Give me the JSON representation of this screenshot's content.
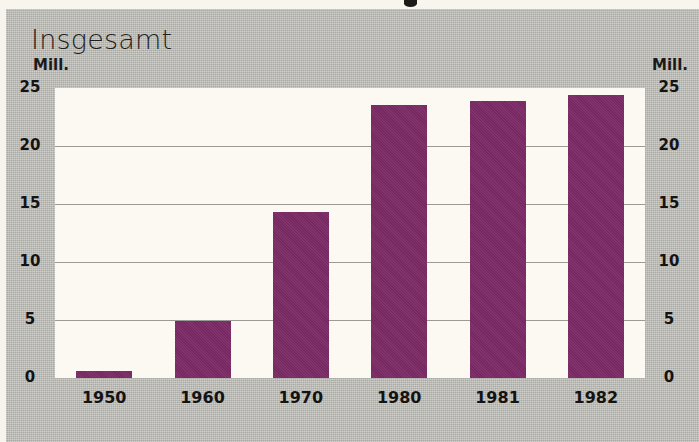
{
  "chart_data": {
    "type": "bar",
    "title": "Insgesamt",
    "xlabel": "",
    "ylabel": "Mill.",
    "unit_label_left": "Mill.",
    "unit_label_right": "Mill.",
    "categories": [
      "1950",
      "1960",
      "1970",
      "1980",
      "1981",
      "1982"
    ],
    "values": [
      0.6,
      4.95,
      14.3,
      23.5,
      23.9,
      24.4
    ],
    "series": [
      {
        "name": "Insgesamt",
        "values": [
          0.6,
          4.95,
          14.3,
          23.5,
          23.9,
          24.4
        ]
      }
    ],
    "ylim": [
      0,
      25
    ],
    "yticks": [
      0,
      5,
      10,
      15,
      20,
      25
    ],
    "ytick_labels": [
      "0",
      "5",
      "10",
      "15",
      "20",
      "25"
    ],
    "ytick_labels_right": [
      "0",
      "5",
      "10",
      "15",
      "20",
      "25"
    ],
    "grid": true,
    "grid_axis": "y",
    "legend": false,
    "legend_position": "none",
    "bar_color": "#7c2a66",
    "plot_background": "#fbf9f2",
    "panel_background": "#b6b5b0",
    "gridline_color": "#9b9b95",
    "text_color": "#141312"
  }
}
